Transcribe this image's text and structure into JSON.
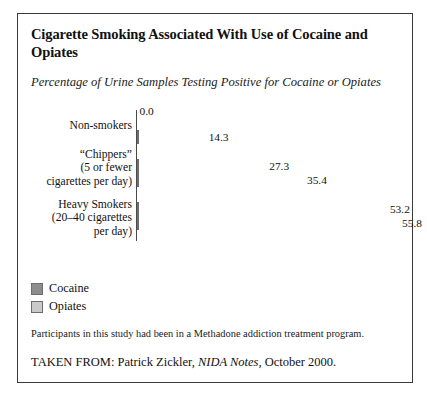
{
  "figure": {
    "title": "Cigarette Smoking Associated With Use of Cocaine and Opiates",
    "subtitle": "Percentage of Urine Samples Testing Positive for Cocaine or Opiates",
    "note": "Participants in this study had been in a Methadone addiction treatment program.",
    "source_prefix": "TAKEN FROM: Patrick Zickler, ",
    "source_italic": "NIDA Notes",
    "source_suffix": ", October 2000."
  },
  "legend": {
    "items": [
      {
        "label": "Cocaine",
        "color": "#8d8d8d",
        "swatch": "cocaine"
      },
      {
        "label": "Opiates",
        "color": "#c9c9c9",
        "swatch": "opiates"
      }
    ]
  },
  "chart_data": {
    "type": "bar",
    "orientation": "horizontal",
    "title": "Cigarette Smoking Associated With Use of Cocaine and Opiates",
    "subtitle": "Percentage of Urine Samples Testing Positive for Cocaine or Opiates",
    "xlabel": "",
    "ylabel": "",
    "xlim": [
      0,
      60
    ],
    "grid": false,
    "legend_position": "bottom-left",
    "categories": [
      "Non-smokers",
      "“Chippers”\n(5 or fewer\ncigarettes per day)",
      "Heavy Smokers\n(20–40 cigarettes\nper day)"
    ],
    "series": [
      {
        "name": "Cocaine",
        "color": "#8d8d8d",
        "values": [
          0.0,
          27.3,
          53.2
        ]
      },
      {
        "name": "Opiates",
        "color": "#c9c9c9",
        "values": [
          14.3,
          35.4,
          55.8
        ]
      }
    ],
    "value_labels": [
      [
        "0.0",
        "14.3"
      ],
      [
        "27.3",
        "35.4"
      ],
      [
        "53.2",
        "55.8"
      ]
    ],
    "annotations": [
      "Participants in this study had been in a Methadone addiction treatment program."
    ]
  }
}
